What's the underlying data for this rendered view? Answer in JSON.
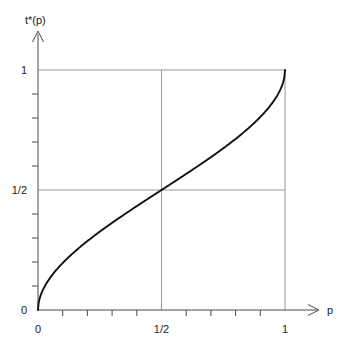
{
  "chart_data": {
    "type": "line",
    "title": "",
    "subtitle": "",
    "xlabel": "p",
    "ylabel": "t*(p)",
    "xlim": [
      0,
      1.12
    ],
    "ylim": [
      0,
      1.06
    ],
    "grid": true,
    "legend": null,
    "x_tick_labels": [
      "0",
      "1/2",
      "1"
    ],
    "x_tick_values": [
      0,
      0.5,
      1
    ],
    "y_tick_labels": [
      "0",
      "1/2",
      "1"
    ],
    "y_tick_values": [
      0,
      0.5,
      1
    ],
    "x_minor_ticks_per_interval": 4,
    "y_minor_ticks_per_interval": 4,
    "gridline_x_values": [
      0.5,
      1
    ],
    "gridline_y_values": [
      0.5,
      1
    ],
    "series": [
      {
        "name": "t*(p)",
        "color": "#111111",
        "x": [
          0.0,
          0.005,
          0.01,
          0.02,
          0.03,
          0.04,
          0.05,
          0.07,
          0.09,
          0.11,
          0.13,
          0.15,
          0.175,
          0.2,
          0.225,
          0.25,
          0.275,
          0.3,
          0.325,
          0.35,
          0.375,
          0.4,
          0.425,
          0.45,
          0.475,
          0.5,
          0.525,
          0.55,
          0.575,
          0.6,
          0.625,
          0.65,
          0.675,
          0.7,
          0.725,
          0.75,
          0.775,
          0.8,
          0.825,
          0.85,
          0.87,
          0.89,
          0.91,
          0.93,
          0.95,
          0.96,
          0.97,
          0.98,
          0.99,
          0.995,
          1.0
        ],
        "y": [
          0.0,
          0.058,
          0.082,
          0.116,
          0.142,
          0.164,
          0.184,
          0.218,
          0.248,
          0.275,
          0.299,
          0.321,
          0.347,
          0.37,
          0.392,
          0.412,
          0.431,
          0.449,
          0.466,
          0.483,
          0.499,
          0.515,
          0.53,
          0.545,
          0.56,
          0.5,
          0.59,
          0.605,
          0.62,
          0.635,
          0.65,
          0.665,
          0.681,
          0.697,
          0.713,
          0.73,
          0.747,
          0.765,
          0.784,
          0.804,
          0.821,
          0.84,
          0.861,
          0.885,
          0.913,
          0.93,
          0.949,
          0.972,
          0.995,
          1.0,
          1.0
        ]
      }
    ],
    "annotations": [],
    "axis_arrows": [
      "x-right",
      "y-up"
    ],
    "curve_description": "Monotone increasing inverse-sigmoid through (0,0), (1/2,1/2) and (1,1) with vertical tangents at both endpoints"
  },
  "labels": {
    "y_axis_name": "t*(p)",
    "x_axis_name": "p",
    "y_tick_0": "0",
    "y_tick_half": "1/2",
    "y_tick_one": "1",
    "x_tick_0": "0",
    "x_tick_half": "1/2",
    "x_tick_one": "1"
  },
  "style": {
    "background": "#ffffff",
    "curve_color": "#111111",
    "axis_color": "#4a4a4a",
    "grid_color": "#8c8c8c"
  }
}
